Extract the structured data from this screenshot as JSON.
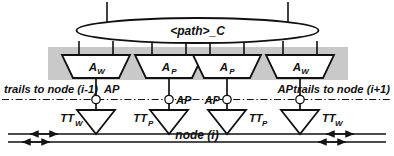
{
  "figure": {
    "kind": "network-node-architecture-diagram",
    "background_color": "#ffffff",
    "line_color": "#111111",
    "band_color": "#c9c9c9"
  },
  "bus": {
    "label": "<path>_C",
    "shape": "ellipse",
    "top_stub_count": 2,
    "drop_line_count": 8
  },
  "amplifiers": [
    {
      "id": "a-w-left",
      "label": "A",
      "subscript": "W",
      "shape": "trapezoid"
    },
    {
      "id": "a-p-left",
      "label": "A",
      "subscript": "P",
      "shape": "trapezoid"
    },
    {
      "id": "a-p-right",
      "label": "A",
      "subscript": "P",
      "shape": "trapezoid"
    },
    {
      "id": "a-w-right",
      "label": "A",
      "subscript": "W",
      "shape": "trapezoid"
    }
  ],
  "trails": {
    "left_label": "trails to node (i-1)",
    "right_label": "trails to node (i+1)",
    "line_style": "dash-dot"
  },
  "access_points": [
    {
      "id": "ap-1",
      "label": "AP",
      "side": "right"
    },
    {
      "id": "ap-2",
      "label": "AP",
      "side": "right"
    },
    {
      "id": "ap-3",
      "label": "AP",
      "side": "left"
    },
    {
      "id": "ap-4",
      "label": "AP",
      "side": "left"
    }
  ],
  "transceivers": [
    {
      "id": "tt-w-left",
      "label": "TT",
      "subscript": "W",
      "shape": "triangle",
      "side": "left"
    },
    {
      "id": "tt-p-left",
      "label": "TT",
      "subscript": "P",
      "shape": "triangle",
      "side": "left"
    },
    {
      "id": "tt-p-right",
      "label": "TT",
      "subscript": "P",
      "shape": "triangle",
      "side": "right"
    },
    {
      "id": "tt-w-right",
      "label": "TT",
      "subscript": "W",
      "shape": "triangle",
      "side": "right"
    }
  ],
  "node": {
    "label": "node (i)"
  },
  "fiber_lines": {
    "count": 2,
    "direction_markers": "bidirectional-arrow-pairs"
  }
}
